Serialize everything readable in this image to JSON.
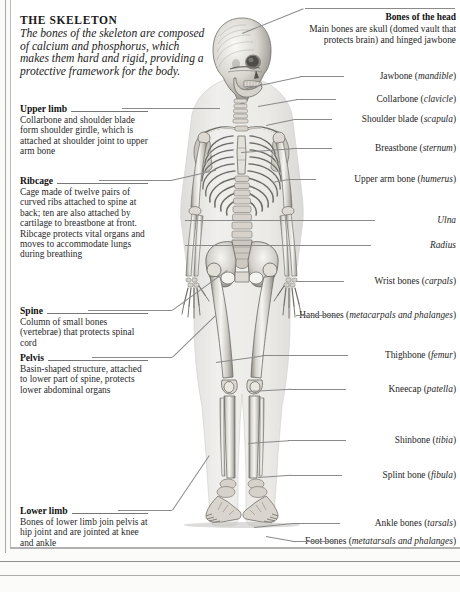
{
  "page": {
    "title": "THE SKELETON",
    "intro": "The bones of the skeleton are composed of calcium and phosphorus, which makes them hard and rigid, providing a protective framework for the body."
  },
  "left_labels": [
    {
      "heading": "Upper limb",
      "body": "Collarbone and shoulder blade form shoulder girdle, which is attached at shoulder joint to upper arm bone"
    },
    {
      "heading": "Ribcage",
      "body": "Cage made of twelve pairs of curved ribs attached to spine at back; ten are also attached by cartilage to breastbone at front. Ribcage protects vital organs and moves to accommodate lungs during breathing"
    },
    {
      "heading": "Spine",
      "body": "Column of small bones (vertebrae) that protects spinal cord"
    },
    {
      "heading": "Pelvis",
      "body": "Basin-shaped structure, attached to lower part of spine, protects lower abdominal organs"
    },
    {
      "heading": "Lower limb",
      "body": "Bones of lower limb join pelvis at hip joint and are jointed at knee and ankle"
    }
  ],
  "right_labels": [
    {
      "name": "Bones of the head",
      "detail": "Main bones are skull (domed vault that protects brain) and hinged jawbone"
    },
    {
      "name": "Jawbone",
      "term": "mandible"
    },
    {
      "name": "Collarbone",
      "term": "clavicle"
    },
    {
      "name": "Shoulder blade",
      "term": "scapula"
    },
    {
      "name": "Breastbone",
      "term": "sternum"
    },
    {
      "name": "Upper arm bone",
      "term": "humerus"
    },
    {
      "name": "",
      "term": "Ulna"
    },
    {
      "name": "",
      "term": "Radius"
    },
    {
      "name": "Wrist bones",
      "term": "carpals"
    },
    {
      "name": "Hand bones",
      "term": "metacarpals and phalanges"
    },
    {
      "name": "Thighbone",
      "term": "femur"
    },
    {
      "name": "Kneecap",
      "term": "patella"
    },
    {
      "name": "Shinbone",
      "term": "tibia"
    },
    {
      "name": "Splint bone",
      "term": "fibula"
    },
    {
      "name": "Ankle bones",
      "term": "tarsals"
    },
    {
      "name": "Foot bones",
      "term": "metatarsals and phalanges"
    }
  ],
  "figure": {
    "alt": "full-length human skeleton, front view, grayscale anatomical engraving"
  },
  "colors": {
    "background": "#fbfbfa",
    "panel": "#ffffff",
    "text": "#232323",
    "rule": "#8a8a8a",
    "bone_light": "#f2f1ee",
    "bone_mid": "#cfccc6",
    "bone_dark": "#8f8c86",
    "body_ghost": "#e9e8e5"
  }
}
